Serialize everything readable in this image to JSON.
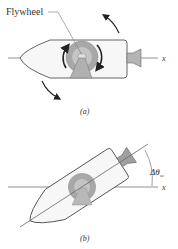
{
  "figure_a": {
    "label": "Flywheel",
    "axis_label": "x",
    "caption": "(a)"
  },
  "figure_b": {
    "axis_label": "x",
    "angle_label": "Δθ",
    "angle_subscript": "sc",
    "caption": "(b)"
  },
  "colors": {
    "body_fill": "#f7f7f7",
    "outline": "#555555",
    "flywheel": "#9a9a9a",
    "flywheel_inner": "#c8c8c8",
    "arrow": "#222222"
  }
}
